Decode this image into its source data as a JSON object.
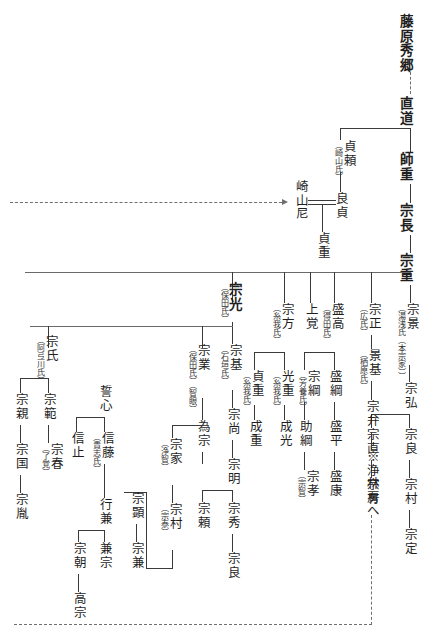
{
  "document": {
    "title": "湯浅氏系図",
    "type": "genealogy-chart",
    "script_direction": "vertical-rtl",
    "ink_color": "#1f1f1f",
    "line_color": "#3a3a3a",
    "background_color": "#ffffff"
  },
  "nodes": {
    "fujiwara_hidesato": {
      "name": "藤原秀郷",
      "anno": ""
    },
    "naomichi": {
      "name": "直道",
      "anno": ""
    },
    "morosige": {
      "name": "師重",
      "anno": ""
    },
    "munenaga": {
      "name": "宗長",
      "anno": ""
    },
    "muneshige": {
      "name": "宗重",
      "anno": ""
    },
    "sadayori": {
      "name": "貞頼",
      "anno": "（崎山氏）"
    },
    "yoshisada": {
      "name": "良貞",
      "anno": ""
    },
    "sakiyama_ama": {
      "name": "崎山尼",
      "anno": ""
    },
    "sadashige": {
      "name": "貞重",
      "anno": ""
    },
    "munekage": {
      "name": "宗景",
      "anno": "（湯浅氏（本宗家））"
    },
    "munehiro": {
      "name": "宗弘",
      "anno": ""
    },
    "muneyoshi": {
      "name": "宗良",
      "anno": ""
    },
    "munemura_honke": {
      "name": "宗村",
      "anno": ""
    },
    "munesada": {
      "name": "宗定",
      "anno": ""
    },
    "munenao": {
      "name": "宗直",
      "anno": ""
    },
    "muneari": {
      "name": "宗有",
      "anno": ""
    },
    "munemasa": {
      "name": "宗正",
      "anno": "（広氏）"
    },
    "kagemoto": {
      "name": "景基",
      "anno": "（栖原氏）"
    },
    "muneben": {
      "name": "宗弁",
      "anno": ""
    },
    "joorinbo_ref": {
      "name": "※浄林房へ",
      "anno": ""
    },
    "moritaka": {
      "name": "盛高",
      "anno": "（得田氏）"
    },
    "moritsuna": {
      "name": "盛綱",
      "anno": ""
    },
    "morihira": {
      "name": "盛平",
      "anno": ""
    },
    "moriyasu": {
      "name": "盛康",
      "anno": ""
    },
    "jokaku": {
      "name": "上覚",
      "anno": ""
    },
    "munetsuna": {
      "name": "宗綱",
      "anno": "（芳養氏）"
    },
    "suketsuna": {
      "name": "助綱",
      "anno": ""
    },
    "munetaka": {
      "name": "宗孝",
      "anno": "（宗智）"
    },
    "munekata": {
      "name": "宗方",
      "anno": "（糸我氏）"
    },
    "mitsushige": {
      "name": "光重",
      "anno": "（糸我氏）"
    },
    "narimitsu": {
      "name": "成光",
      "anno": ""
    },
    "sadashige2": {
      "name": "貞重",
      "anno": "（糸我氏）"
    },
    "narishige": {
      "name": "成重",
      "anno": ""
    },
    "munemitsu": {
      "name": "宗光",
      "anno": "（保田氏）"
    },
    "munemoto": {
      "name": "宗基",
      "anno": "（石垣氏）"
    },
    "munehisa": {
      "name": "宗尚",
      "anno": ""
    },
    "muneaki": {
      "name": "宗明",
      "anno": ""
    },
    "munehide": {
      "name": "宗秀",
      "anno": ""
    },
    "muneyoshi2": {
      "name": "宗良",
      "anno": ""
    },
    "muneyori": {
      "name": "宗頼",
      "anno": ""
    },
    "munenari": {
      "name": "宗業",
      "anno": "（保田氏）（智眼）"
    },
    "tamemune": {
      "name": "為宗",
      "anno": ""
    },
    "muneie": {
      "name": "宗家",
      "anno": "（浄智）"
    },
    "munemura2": {
      "name": "宗村",
      "anno": "（宗泰）"
    },
    "muneaki2": {
      "name": "宗顕",
      "anno": ""
    },
    "munekane": {
      "name": "宗兼",
      "anno": ""
    },
    "seishin": {
      "name": "誓心",
      "anno": ""
    },
    "nobufuji": {
      "name": "信藤",
      "anno": "（貴志氏）"
    },
    "nobutome": {
      "name": "信止",
      "anno": ""
    },
    "yukikane": {
      "name": "行兼",
      "anno": ""
    },
    "kanemune": {
      "name": "兼宗",
      "anno": ""
    },
    "munetomo": {
      "name": "宗朝",
      "anno": ""
    },
    "takamune": {
      "name": "高宗",
      "anno": ""
    },
    "muneuji": {
      "name": "宗氏",
      "anno": "（阿弖川氏）"
    },
    "munenori": {
      "name": "宗範",
      "anno": ""
    },
    "muneharu": {
      "name": "宗春",
      "anno": "（了覚）"
    },
    "munechika": {
      "name": "宗親",
      "anno": ""
    },
    "munekuni": {
      "name": "宗国",
      "anno": ""
    },
    "munetane": {
      "name": "宗胤",
      "anno": ""
    }
  }
}
